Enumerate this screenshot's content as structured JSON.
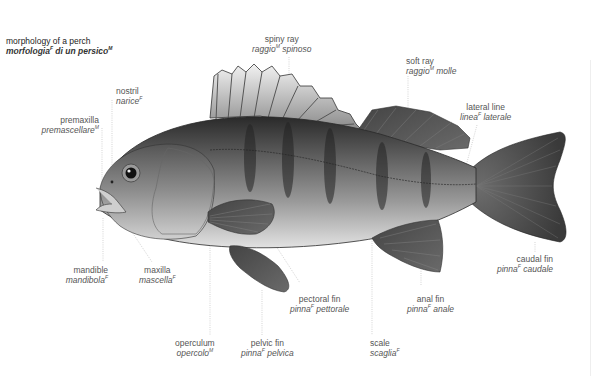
{
  "title": {
    "en": "morphology of a perch",
    "it": "morfologia",
    "it_gender": "F",
    "it_rest": " di un persico",
    "it_rest_gender": "M"
  },
  "labels": [
    {
      "id": "spiny-ray",
      "en": "spiny ray",
      "it": "raggio",
      "gender": "M",
      "it_rest": " spinoso"
    },
    {
      "id": "soft-ray",
      "en": "soft ray",
      "it": "raggio",
      "gender": "M",
      "it_rest": " molle"
    },
    {
      "id": "nostril",
      "en": "nostril",
      "it": "narice",
      "gender": "F",
      "it_rest": ""
    },
    {
      "id": "premaxilla",
      "en": "premaxilla",
      "it": "premascellare",
      "gender": "M",
      "it_rest": ""
    },
    {
      "id": "lateral-line",
      "en": "lateral line",
      "it": "linea",
      "gender": "F",
      "it_rest": " laterale"
    },
    {
      "id": "caudal-fin",
      "en": "caudal fin",
      "it": "pinna",
      "gender": "F",
      "it_rest": " caudale"
    },
    {
      "id": "mandible",
      "en": "mandible",
      "it": "mandibola",
      "gender": "F",
      "it_rest": ""
    },
    {
      "id": "maxilla",
      "en": "maxilla",
      "it": "mascella",
      "gender": "F",
      "it_rest": ""
    },
    {
      "id": "pectoral-fin",
      "en": "pectoral fin",
      "it": "pinna",
      "gender": "F",
      "it_rest": " pettorale"
    },
    {
      "id": "anal-fin",
      "en": "anal fin",
      "it": "pinna",
      "gender": "F",
      "it_rest": " anale"
    },
    {
      "id": "operculum",
      "en": "operculum",
      "it": "opercolo",
      "gender": "M",
      "it_rest": ""
    },
    {
      "id": "pelvic-fin",
      "en": "pelvic fin",
      "it": "pinna",
      "gender": "F",
      "it_rest": " pelvica"
    },
    {
      "id": "scale",
      "en": "scale",
      "it": "scaglia",
      "gender": "F",
      "it_rest": ""
    }
  ],
  "colors": {
    "body_dark": "#2e2e2e",
    "body_mid": "#7a7a7a",
    "belly": "#d8d8d8",
    "fin": "#555555",
    "leader_line": "#bdbdbd",
    "text": "#555555"
  }
}
